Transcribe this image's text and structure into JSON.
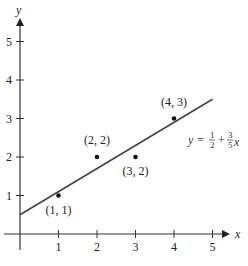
{
  "chart_data": {
    "type": "scatter",
    "title": "",
    "xlabel": "x",
    "ylabel": "y",
    "xlim": [
      0,
      5.5
    ],
    "ylim": [
      0,
      5.5
    ],
    "grid": false,
    "x_ticks": [
      "1",
      "2",
      "3",
      "4",
      "5"
    ],
    "y_ticks": [
      "1",
      "2",
      "3",
      "4",
      "5"
    ],
    "points": [
      {
        "x": 1,
        "y": 1,
        "label": "(1, 1)"
      },
      {
        "x": 2,
        "y": 2,
        "label": "(2, 2)"
      },
      {
        "x": 3,
        "y": 2,
        "label": "(3, 2)"
      },
      {
        "x": 4,
        "y": 3,
        "label": "(4, 3)"
      }
    ],
    "series": [
      {
        "name": "regression line",
        "type": "line",
        "x": [
          0,
          5
        ],
        "values": [
          0.5,
          3.5
        ]
      }
    ],
    "annotations": [
      {
        "text": "y = 1/2 + 3/5 x",
        "position": [
          4.2,
          2.3
        ]
      }
    ],
    "equation": {
      "lhs": "y",
      "eq": "=",
      "frac1_num": "1",
      "frac1_den": "2",
      "plus": "+",
      "frac2_num": "3",
      "frac2_den": "5",
      "var": "x"
    }
  }
}
